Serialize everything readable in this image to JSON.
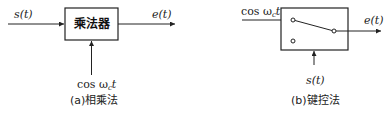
{
  "diagram_a": {
    "input_label": "s(t)",
    "output_label": "e(t)",
    "block_label": "乘法器",
    "carrier_label": "cos ω",
    "carrier_sub": "c",
    "carrier_t": "t",
    "caption": "(a)相乘法"
  },
  "diagram_b": {
    "carrier_label": "cos ω",
    "carrier_sub": "c",
    "carrier_t": "t",
    "output_label": "e(t)",
    "control_label": "s(t)",
    "caption": "(b)键控法"
  },
  "colors": {
    "line": "#222222",
    "background": "#ffffff"
  }
}
